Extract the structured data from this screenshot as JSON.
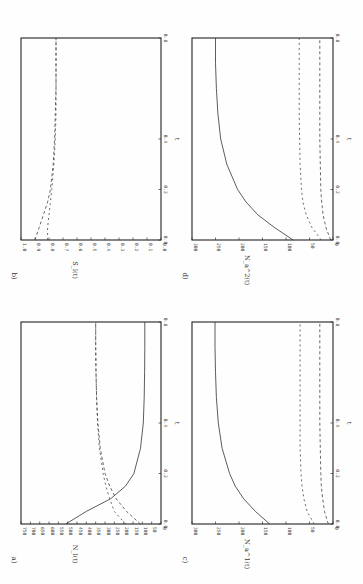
{
  "chart_data": [
    {
      "panel": "a)",
      "type": "line",
      "xlabel": "t",
      "ylabel": "N_l(t)",
      "xlim": [
        0.0,
        0.8
      ],
      "ylim": [
        0,
        750
      ],
      "xticks": [
        "0.0",
        "0.2",
        "0.4",
        "0.8"
      ],
      "xtick_values": [
        0.0,
        0.2,
        0.4,
        0.8
      ],
      "yticks": [
        "0",
        "50",
        "100",
        "150",
        "200",
        "250",
        "300",
        "350",
        "400",
        "450",
        "500",
        "550",
        "600",
        "650",
        "700",
        "750"
      ],
      "x": [
        0.0,
        0.05,
        0.1,
        0.15,
        0.2,
        0.3,
        0.4,
        0.5,
        0.6,
        0.7,
        0.8
      ],
      "series": [
        {
          "name": "solid",
          "style": "solid",
          "values": [
            510,
            400,
            270,
            190,
            145,
            110,
            95,
            90,
            88,
            87,
            87
          ]
        },
        {
          "name": "dashed-1",
          "style": "dashed",
          "values": [
            190,
            250,
            275,
            295,
            310,
            330,
            340,
            345,
            348,
            350,
            350
          ]
        },
        {
          "name": "dashed-2",
          "style": "dashed",
          "values": [
            110,
            185,
            240,
            275,
            300,
            325,
            338,
            345,
            348,
            350,
            350
          ]
        }
      ]
    },
    {
      "panel": "b)",
      "type": "line",
      "xlabel": "t",
      "ylabel": "S_l(t)",
      "xlim": [
        0.0,
        0.8
      ],
      "ylim": [
        0.0,
        1.0
      ],
      "xticks": [
        "0.0",
        "0.2",
        "0.4",
        "0.8"
      ],
      "xtick_values": [
        0.0,
        0.2,
        0.4,
        0.8
      ],
      "yticks": [
        "0.0",
        "0.1",
        "0.2",
        "0.3",
        "0.4",
        "0.5",
        "0.6",
        "0.7",
        "0.8",
        "0.9",
        "1.0"
      ],
      "x": [
        0.0,
        0.05,
        0.1,
        0.15,
        0.2,
        0.3,
        0.4,
        0.5,
        0.6,
        0.7,
        0.8
      ],
      "series": [
        {
          "name": "dashed-1",
          "style": "dashed",
          "values": [
            0.9,
            0.87,
            0.84,
            0.81,
            0.79,
            0.77,
            0.76,
            0.755,
            0.75,
            0.75,
            0.75
          ]
        },
        {
          "name": "dashed-2",
          "style": "dashed",
          "values": [
            0.81,
            0.81,
            0.8,
            0.79,
            0.78,
            0.765,
            0.755,
            0.75,
            0.75,
            0.75,
            0.75
          ]
        }
      ]
    },
    {
      "panel": "c)",
      "type": "line",
      "xlabel": "t",
      "ylabel": "N_a^1(t)",
      "xlim": [
        0.0,
        0.8
      ],
      "ylim": [
        0,
        300
      ],
      "xticks": [
        "0.0",
        "0.2",
        "0.4",
        "0.8"
      ],
      "xtick_values": [
        0.0,
        0.2,
        0.4,
        0.8
      ],
      "yticks": [
        "0",
        "50",
        "100",
        "150",
        "200",
        "250",
        "300"
      ],
      "x": [
        0.0,
        0.05,
        0.1,
        0.15,
        0.2,
        0.3,
        0.4,
        0.5,
        0.6,
        0.7,
        0.8
      ],
      "series": [
        {
          "name": "solid",
          "style": "solid",
          "values": [
            135,
            165,
            190,
            208,
            220,
            236,
            244,
            248,
            250,
            251,
            251
          ]
        },
        {
          "name": "dashed-1",
          "style": "dashed",
          "values": [
            40,
            55,
            62,
            66,
            68,
            70,
            70,
            70,
            70,
            70,
            70
          ]
        },
        {
          "name": "dashed-2",
          "style": "dashed",
          "values": [
            10,
            18,
            22,
            25,
            26,
            27,
            28,
            28,
            28,
            28,
            28
          ]
        }
      ]
    },
    {
      "panel": "d)",
      "type": "line",
      "xlabel": "t",
      "ylabel": "N_a^2(t)",
      "xlim": [
        0.0,
        0.8
      ],
      "ylim": [
        0,
        300
      ],
      "xticks": [
        "0.0",
        "0.2",
        "0.4",
        "0.8"
      ],
      "xtick_values": [
        0.0,
        0.2,
        0.4,
        0.8
      ],
      "yticks": [
        "0",
        "50",
        "100",
        "150",
        "200",
        "250",
        "300"
      ],
      "x": [
        0.0,
        0.05,
        0.1,
        0.15,
        0.2,
        0.3,
        0.4,
        0.5,
        0.6,
        0.7,
        0.8
      ],
      "series": [
        {
          "name": "solid",
          "style": "solid",
          "values": [
            85,
            125,
            160,
            185,
            203,
            226,
            239,
            245,
            248,
            250,
            250
          ]
        },
        {
          "name": "dashed-1",
          "style": "dashed",
          "values": [
            25,
            45,
            57,
            64,
            67,
            70,
            71,
            72,
            72,
            72,
            72
          ]
        },
        {
          "name": "dashed-2",
          "style": "dashed",
          "values": [
            5,
            15,
            21,
            24,
            26,
            27,
            28,
            28,
            28,
            28,
            28
          ]
        }
      ]
    }
  ]
}
